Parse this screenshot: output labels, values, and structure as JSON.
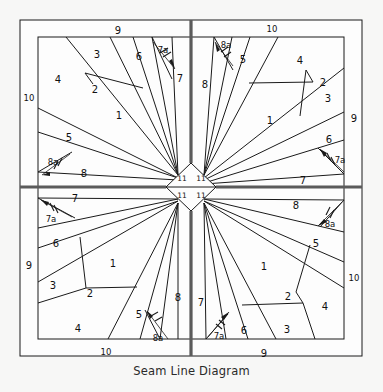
{
  "caption": "Seam Line Diagram",
  "diagram": {
    "type": "quilt-foundation-piecing-seam-line-diagram",
    "title": "Seam Line Diagram",
    "symmetry": "four-quadrant rotational (pinwheel) symmetry about the block centre",
    "background_color": "#f7f7f6",
    "fabric_fill_color": "#fdfdfd",
    "seam_line_color": "#1a1a1a",
    "center_cross_color": "#5b5b5b",
    "label_color": "#111111",
    "piece_number_range": "1 to 11",
    "distinct_piece_numbers": [
      "1",
      "2",
      "3",
      "4",
      "5",
      "6",
      "7",
      "7a",
      "8",
      "8a",
      "9",
      "10",
      "11"
    ],
    "center": {
      "x": 191,
      "y": 187,
      "shape": "diamond",
      "piece_count": 4,
      "piece_number": "11"
    },
    "center_diamond_labels": [
      {
        "id": "c-tl",
        "text": "11",
        "x": 182,
        "y": 179
      },
      {
        "id": "c-tr",
        "text": "11",
        "x": 201,
        "y": 179
      },
      {
        "id": "c-bl",
        "text": "11",
        "x": 182,
        "y": 196
      },
      {
        "id": "c-br",
        "text": "11",
        "x": 201,
        "y": 196
      }
    ],
    "border_strips": [
      {
        "id": "strip-top-left",
        "label": "9",
        "edge": "top",
        "half": "left",
        "x": 118,
        "y": 31
      },
      {
        "id": "strip-top-right",
        "label": "10",
        "edge": "top",
        "half": "right",
        "x": 272,
        "y": 29
      },
      {
        "id": "strip-bottom-left",
        "label": "10",
        "edge": "bottom",
        "half": "left",
        "x": 106,
        "y": 352
      },
      {
        "id": "strip-bottom-right",
        "label": "9",
        "edge": "bottom",
        "half": "right",
        "x": 264,
        "y": 354
      },
      {
        "id": "strip-left-top",
        "label": "10",
        "edge": "left",
        "half": "top",
        "x": 29,
        "y": 98
      },
      {
        "id": "strip-left-bottom",
        "label": "9",
        "edge": "left",
        "half": "bottom",
        "x": 29,
        "y": 266
      },
      {
        "id": "strip-right-top",
        "label": "9",
        "edge": "right",
        "half": "top",
        "x": 354,
        "y": 119
      },
      {
        "id": "strip-right-bottom",
        "label": "10",
        "edge": "right",
        "half": "bottom",
        "x": 354,
        "y": 278
      }
    ],
    "quadrants": [
      {
        "id": "quadrant-top-left",
        "name": "Top Left",
        "labels": [
          {
            "text": "3",
            "x": 97,
            "y": 55
          },
          {
            "text": "6",
            "x": 139,
            "y": 57
          },
          {
            "text": "7a",
            "x": 163,
            "y": 50
          },
          {
            "text": "7",
            "x": 180,
            "y": 79
          },
          {
            "text": "4",
            "x": 58,
            "y": 80
          },
          {
            "text": "2",
            "x": 95,
            "y": 90
          },
          {
            "text": "1",
            "x": 119,
            "y": 116
          },
          {
            "text": "5",
            "x": 69,
            "y": 138
          },
          {
            "text": "8a",
            "x": 53,
            "y": 162
          },
          {
            "text": "8",
            "x": 84,
            "y": 174
          }
        ]
      },
      {
        "id": "quadrant-top-right",
        "name": "Top Right",
        "labels": [
          {
            "text": "8a",
            "x": 226,
            "y": 45
          },
          {
            "text": "8",
            "x": 205,
            "y": 85
          },
          {
            "text": "5",
            "x": 243,
            "y": 60
          },
          {
            "text": "4",
            "x": 300,
            "y": 61
          },
          {
            "text": "2",
            "x": 323,
            "y": 83
          },
          {
            "text": "3",
            "x": 328,
            "y": 99
          },
          {
            "text": "1",
            "x": 270,
            "y": 121
          },
          {
            "text": "6",
            "x": 329,
            "y": 140
          },
          {
            "text": "7a",
            "x": 340,
            "y": 160
          },
          {
            "text": "7",
            "x": 303,
            "y": 181
          }
        ]
      },
      {
        "id": "quadrant-bottom-left",
        "name": "Bottom Left",
        "labels": [
          {
            "text": "7",
            "x": 75,
            "y": 199
          },
          {
            "text": "7a",
            "x": 51,
            "y": 219
          },
          {
            "text": "6",
            "x": 56,
            "y": 244
          },
          {
            "text": "3",
            "x": 53,
            "y": 286
          },
          {
            "text": "2",
            "x": 90,
            "y": 294
          },
          {
            "text": "1",
            "x": 113,
            "y": 264
          },
          {
            "text": "4",
            "x": 78,
            "y": 329
          },
          {
            "text": "5",
            "x": 139,
            "y": 315
          },
          {
            "text": "8a",
            "x": 158,
            "y": 338
          },
          {
            "text": "8",
            "x": 178,
            "y": 298
          }
        ]
      },
      {
        "id": "quadrant-bottom-right",
        "name": "Bottom Right",
        "labels": [
          {
            "text": "8",
            "x": 296,
            "y": 206
          },
          {
            "text": "8a",
            "x": 330,
            "y": 224
          },
          {
            "text": "5",
            "x": 316,
            "y": 244
          },
          {
            "text": "1",
            "x": 264,
            "y": 267
          },
          {
            "text": "2",
            "x": 288,
            "y": 297
          },
          {
            "text": "4",
            "x": 325,
            "y": 307
          },
          {
            "text": "3",
            "x": 287,
            "y": 330
          },
          {
            "text": "6",
            "x": 244,
            "y": 331
          },
          {
            "text": "7a",
            "x": 219,
            "y": 336
          },
          {
            "text": "7",
            "x": 201,
            "y": 303
          }
        ]
      }
    ],
    "seam_arrows": [
      {
        "id": "arrow-tl-7a",
        "note": "hash-marked arrow on 7a seam, top-left quadrant"
      },
      {
        "id": "arrow-tl-8a",
        "note": "hash-marked arrow on 8a seam, top-left quadrant"
      },
      {
        "id": "arrow-tr-8a",
        "note": "hash-marked arrow on 8a seam, top-right quadrant"
      },
      {
        "id": "arrow-tr-7a",
        "note": "hash-marked arrow on 7a seam, top-right quadrant"
      },
      {
        "id": "arrow-bl-7a",
        "note": "hash-marked arrow on 7a seam, bottom-left quadrant"
      },
      {
        "id": "arrow-bl-8a",
        "note": "hash-marked arrow on 8a seam, bottom-left quadrant"
      },
      {
        "id": "arrow-br-8a",
        "note": "hash-marked arrow on 8a seam, bottom-right quadrant"
      },
      {
        "id": "arrow-br-7a",
        "note": "hash-marked arrow on 7a seam, bottom-right quadrant"
      }
    ]
  }
}
